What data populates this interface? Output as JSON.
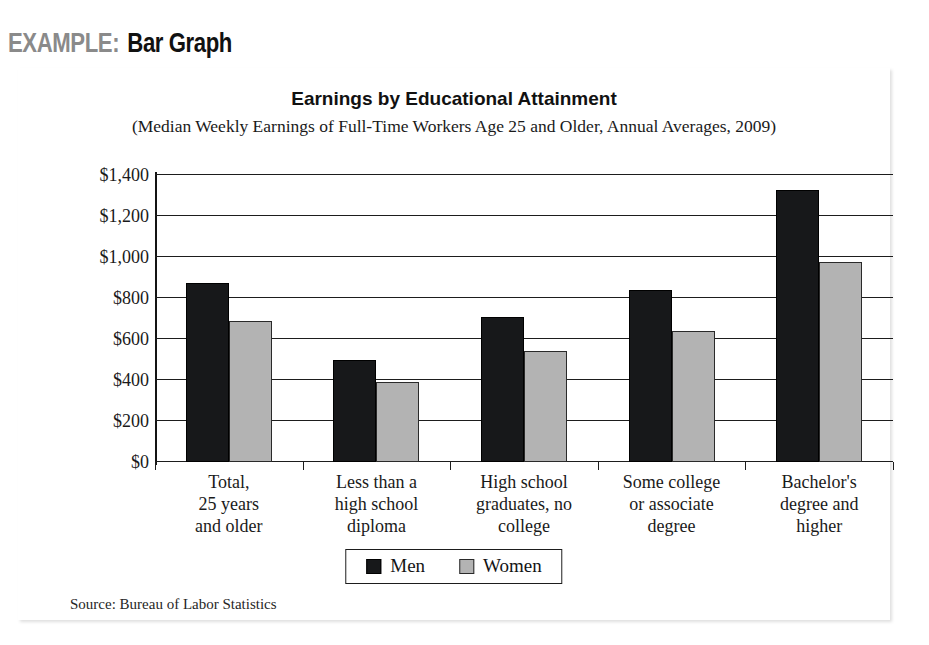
{
  "header": {
    "example_word": "EXAMPLE:",
    "type_word": "Bar Graph"
  },
  "figure": {
    "source_note": "Source: Bureau of Labor Statistics"
  },
  "legend": {
    "entries": [
      {
        "label": "Men",
        "color": "#17181a",
        "swatch": "men"
      },
      {
        "label": "Women",
        "color": "#b3b3b3",
        "swatch": "women"
      }
    ]
  },
  "chart_data": {
    "type": "bar",
    "title": "Earnings by Educational Attainment",
    "subtitle": "(Median Weekly Earnings of Full-Time Workers Age 25 and Older, Annual Averages, 2009)",
    "xlabel": "",
    "ylabel": "",
    "ylim": [
      0,
      1400
    ],
    "yticks": [
      0,
      200,
      400,
      600,
      800,
      1000,
      1200,
      1400
    ],
    "ytick_labels": [
      "$0",
      "$200",
      "$400",
      "$600",
      "$800",
      "$1,000",
      "$1,200",
      "$1,400"
    ],
    "grid": true,
    "legend_position": "bottom-center",
    "categories": [
      "Total,\n25 years\nand older",
      "Less than a\nhigh school\ndiploma",
      "High school\ngraduates, no\ncollege",
      "Some college\nor associate\ndegree",
      "Bachelor's\ndegree and\nhigher"
    ],
    "category_lines": [
      [
        "Total,",
        "25 years",
        "and older"
      ],
      [
        "Less than a",
        "high school",
        "diploma"
      ],
      [
        "High school",
        "graduates, no",
        "college"
      ],
      [
        "Some college",
        "or associate",
        "degree"
      ],
      [
        "Bachelor's",
        "degree and",
        "higher"
      ]
    ],
    "series": [
      {
        "name": "Men",
        "color": "#17181a",
        "values": [
          873,
          500,
          709,
          840,
          1327
        ]
      },
      {
        "name": "Women",
        "color": "#b3b3b3",
        "values": [
          689,
          389,
          543,
          639,
          977
        ]
      }
    ]
  }
}
